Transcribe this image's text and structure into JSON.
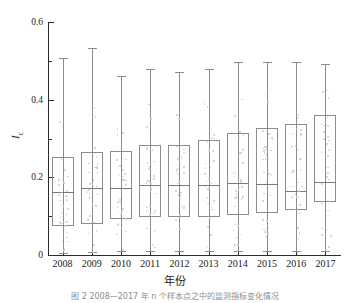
{
  "figure": {
    "caption": "图 2  2008—2017 年 n 个样本点之中的监测指标变化情况",
    "x_axis_title": "年份",
    "y_axis_title_main": "I",
    "y_axis_title_sub": "c"
  },
  "chart_data": {
    "type": "box",
    "title": "",
    "xlabel": "年份",
    "ylabel": "Ic",
    "ylim": [
      0,
      0.6
    ],
    "yticks": [
      0,
      0.2,
      0.4,
      0.6
    ],
    "ytick_labels": [
      "0",
      "0.2",
      "0.4",
      "0.6"
    ],
    "yminor_ticks": [
      0.1,
      0.3,
      0.5
    ],
    "grid": false,
    "legend": "none",
    "categories": [
      "2008",
      "2009",
      "2010",
      "2011",
      "2012",
      "2013",
      "2014",
      "2015",
      "2016",
      "2017"
    ],
    "boxes": [
      {
        "year": "2008",
        "whisker_low": 0.005,
        "q1": 0.075,
        "median": 0.163,
        "q3": 0.253,
        "whisker_high": 0.508
      },
      {
        "year": "2009",
        "whisker_low": 0.008,
        "q1": 0.08,
        "median": 0.172,
        "q3": 0.265,
        "whisker_high": 0.532
      },
      {
        "year": "2010",
        "whisker_low": 0.01,
        "q1": 0.093,
        "median": 0.173,
        "q3": 0.268,
        "whisker_high": 0.462
      },
      {
        "year": "2011",
        "whisker_low": 0.01,
        "q1": 0.098,
        "median": 0.181,
        "q3": 0.283,
        "whisker_high": 0.478
      },
      {
        "year": "2012",
        "whisker_low": 0.01,
        "q1": 0.098,
        "median": 0.181,
        "q3": 0.284,
        "whisker_high": 0.47
      },
      {
        "year": "2013",
        "whisker_low": 0.01,
        "q1": 0.097,
        "median": 0.181,
        "q3": 0.297,
        "whisker_high": 0.478
      },
      {
        "year": "2014",
        "whisker_low": 0.01,
        "q1": 0.103,
        "median": 0.185,
        "q3": 0.313,
        "whisker_high": 0.497
      },
      {
        "year": "2015",
        "whisker_low": 0.01,
        "q1": 0.107,
        "median": 0.183,
        "q3": 0.327,
        "whisker_high": 0.497
      },
      {
        "year": "2016",
        "whisker_low": 0.01,
        "q1": 0.117,
        "median": 0.166,
        "q3": 0.338,
        "whisker_high": 0.497
      },
      {
        "year": "2017",
        "whisker_low": 0.01,
        "q1": 0.137,
        "median": 0.188,
        "q3": 0.36,
        "whisker_high": 0.492
      }
    ],
    "scatter_note": "light grey jittered sample points overlaid on each box"
  }
}
